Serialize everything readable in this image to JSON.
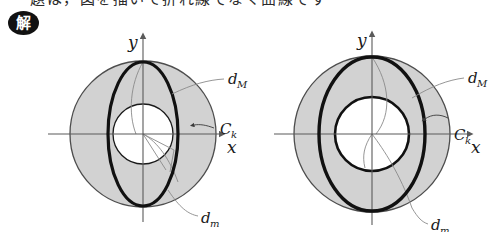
{
  "page": {
    "clipped_header_text": "題は，図を描いて折れ線でなく曲線です",
    "solution_badge": "解"
  },
  "figures": [
    {
      "id": "left",
      "name": "figure-annulus-narrow-ellipse",
      "axes": {
        "x_label": "x",
        "y_label": "y"
      },
      "labels": {
        "major_diameter": "d",
        "major_diameter_sub": "M",
        "minor_diameter": "d",
        "minor_diameter_sub": "m",
        "curve": "C",
        "curve_sub": "k"
      },
      "geometry": {
        "origin_x": 95,
        "origin_y": 112,
        "outer_circle_r": 73,
        "inner_circle_r": 30,
        "ellipse_rx": 35,
        "ellipse_ry": 72,
        "annulus_fill": "#d2d2d2",
        "inner_fill": "#ffffff",
        "stroke": "#1a1a1a"
      }
    },
    {
      "id": "right",
      "name": "figure-annulus-wide-ellipse",
      "axes": {
        "x_label": "x",
        "y_label": "y"
      },
      "labels": {
        "major_diameter": "d",
        "major_diameter_sub": "M",
        "minor_diameter": "d",
        "minor_diameter_sub": "m",
        "curve": "C",
        "curve_sub": "k"
      },
      "geometry": {
        "origin_x": 100,
        "origin_y": 112,
        "outer_circle_r": 78,
        "inner_circle_r": 37,
        "ellipse_rx": 53,
        "ellipse_ry": 77,
        "annulus_fill": "#d2d2d2",
        "inner_fill": "#ffffff",
        "stroke": "#1a1a1a"
      }
    }
  ],
  "colors": {
    "page_background": "#ffffff",
    "ink": "#1a1a1a",
    "shade_gray": "#d2d2d2",
    "thin_line": "#7a7a7a",
    "badge_background": "#111111"
  }
}
